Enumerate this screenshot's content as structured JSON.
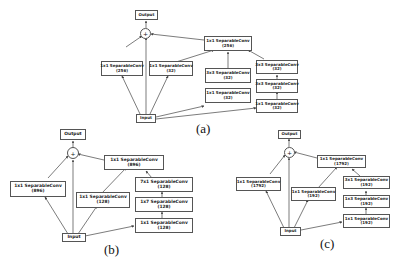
{
  "diagrams": {
    "a": {
      "caption": "(a)",
      "output": "Output",
      "plus": "+",
      "input": "Input",
      "left": {
        "name": "1x1 SeparableConv",
        "ch": "(256)"
      },
      "mid": {
        "name": "1x1 SeparableConv",
        "ch": "(32)"
      },
      "top": {
        "name": "1x1 SeparableConv",
        "ch": "(256)"
      },
      "col2_top": {
        "name": "3x3 SeparableConv",
        "ch": "(32)"
      },
      "col2_bot": {
        "name": "1x1 SeparableConv",
        "ch": "(32)"
      },
      "col3_top": {
        "name": "3x3 SeparableConv",
        "ch": "(32)"
      },
      "col3_mid": {
        "name": "3x3 SeparableConv",
        "ch": "(32)"
      },
      "col3_bot": {
        "name": "1x1 SeparableConv",
        "ch": "(32)"
      }
    },
    "b": {
      "caption": "(b)",
      "output": "Output",
      "plus": "+",
      "input": "Input",
      "left": {
        "name": "1x1 SeparableConv",
        "ch": "(896)"
      },
      "mid": {
        "name": "1x1 SeparableConv",
        "ch": "(128)"
      },
      "top": {
        "name": "1x1 SeparableConv",
        "ch": "(896)"
      },
      "col_top": {
        "name": "7x1 SeparableConv",
        "ch": "(128)"
      },
      "col_mid": {
        "name": "1x7 SeparableConv",
        "ch": "(128)"
      },
      "col_bot": {
        "name": "1x1 SeparableConv",
        "ch": "(128)"
      }
    },
    "c": {
      "caption": "(c)",
      "output": "Output",
      "plus": "+",
      "input": "Input",
      "left": {
        "name": "1x1 SeparableConv",
        "ch": "(1792)"
      },
      "mid": {
        "name": "1x1 SeparableConv",
        "ch": "(192)"
      },
      "top": {
        "name": "1x1 SeparableConv",
        "ch": "(1792)"
      },
      "col_top": {
        "name": "3x1 SeparableConv",
        "ch": "(192)"
      },
      "col_mid": {
        "name": "1x3 SeparableConv",
        "ch": "(192)"
      },
      "col_bot": {
        "name": "1x1 SeparableConv",
        "ch": "(192)"
      }
    }
  }
}
